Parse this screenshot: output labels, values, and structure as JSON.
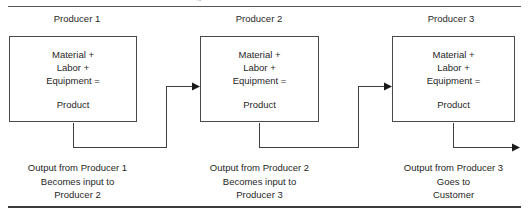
{
  "diagram": {
    "title_fragment": "g",
    "top_rule": true,
    "bottom_rule": true,
    "line_color": "#3f3f3f",
    "text_color": "#1f1f1f",
    "background": "#ffffff"
  },
  "columns": [
    {
      "header": "Producer 1",
      "box": {
        "line1": "Material +",
        "line2": "Labor +",
        "line3": "Equipment =",
        "line4": "Product"
      },
      "caption": {
        "line1": "Output from Producer 1",
        "line2": "Becomes input to",
        "line3": "Producer 2"
      }
    },
    {
      "header": "Producer 2",
      "box": {
        "line1": "Material +",
        "line2": "Labor +",
        "line3": "Equipment =",
        "line4": "Product"
      },
      "caption": {
        "line1": "Output from Producer 2",
        "line2": "Becomes input to",
        "line3": "Producer 3"
      }
    },
    {
      "header": "Producer 3",
      "box": {
        "line1": "Material +",
        "line2": "Labor +",
        "line3": "Equipment =",
        "line4": "Product"
      },
      "caption": {
        "line1": "Output from Producer 3",
        "line2": "Goes to",
        "line3": "Customer"
      }
    }
  ],
  "connectors": [
    {
      "name": "producer-1-to-producer-2",
      "from": "Producer 1",
      "to": "Producer 2"
    },
    {
      "name": "producer-2-to-producer-3",
      "from": "Producer 2",
      "to": "Producer 3"
    },
    {
      "name": "producer-3-to-customer",
      "from": "Producer 3",
      "to": "Customer"
    }
  ]
}
